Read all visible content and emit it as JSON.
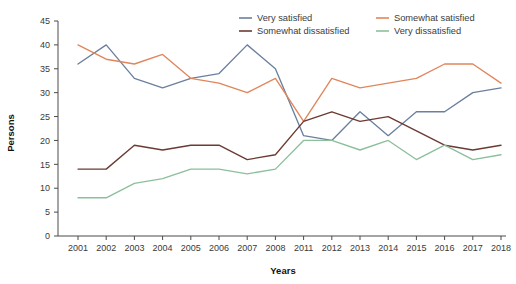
{
  "chart_data": {
    "type": "line",
    "title": "",
    "xlabel": "Years",
    "ylabel": "Persons",
    "categories": [
      "2001",
      "2002",
      "2003",
      "2004",
      "2005",
      "2006",
      "2007",
      "2008",
      "2011",
      "2012",
      "2013",
      "2014",
      "2015",
      "2016",
      "2017",
      "2018"
    ],
    "ylim": [
      0,
      45
    ],
    "yticks": [
      0,
      5,
      10,
      15,
      20,
      25,
      30,
      35,
      40,
      45
    ],
    "grid": false,
    "legend_position": "top-right",
    "series": [
      {
        "name": "Very satisfied",
        "color": "#6b7f9e",
        "values": [
          36,
          40,
          33,
          31,
          33,
          34,
          40,
          35,
          21,
          20,
          26,
          21,
          26,
          26,
          30,
          31
        ]
      },
      {
        "name": "Somewhat satisfied",
        "color": "#e0865a",
        "values": [
          40,
          37,
          36,
          38,
          33,
          32,
          30,
          33,
          24,
          33,
          31,
          32,
          33,
          36,
          36,
          32
        ]
      },
      {
        "name": "Somewhat dissatisfied",
        "color": "#6b3a32",
        "values": [
          14,
          14,
          19,
          18,
          19,
          19,
          16,
          17,
          24,
          26,
          24,
          25,
          22,
          19,
          18,
          19
        ]
      },
      {
        "name": "Very dissatisfied",
        "color": "#8cbf9c",
        "values": [
          8,
          8,
          11,
          12,
          14,
          14,
          13,
          14,
          20,
          20,
          18,
          20,
          16,
          19,
          16,
          17
        ]
      }
    ]
  },
  "legend": {
    "items": [
      {
        "label": "Very satisfied",
        "color": "#6b7f9e"
      },
      {
        "label": "Somewhat satisfied",
        "color": "#e0865a"
      },
      {
        "label": "Somewhat dissatisfied",
        "color": "#6b3a32"
      },
      {
        "label": "Very dissatisfied",
        "color": "#8cbf9c"
      }
    ]
  },
  "axes": {
    "x_title": "Years",
    "y_title": "Persons"
  }
}
